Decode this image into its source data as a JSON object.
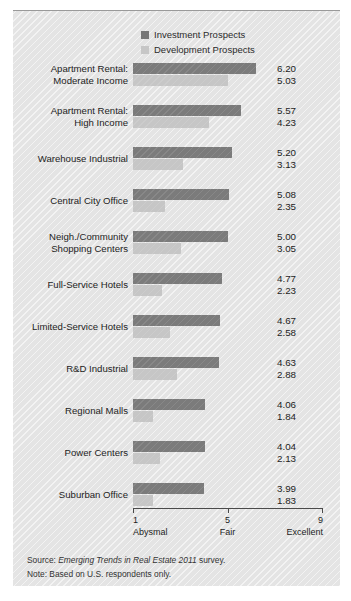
{
  "chart_data": {
    "type": "bar",
    "orientation": "horizontal",
    "title": "",
    "xlabel": "",
    "ylabel": "",
    "xlim": [
      1,
      9
    ],
    "grid": false,
    "legend_position": "top-center",
    "categories": [
      "Apartment Rental:\nModerate Income",
      "Apartment Rental:\nHigh Income",
      "Warehouse Industrial",
      "Central City Office",
      "Neigh./Community\nShopping Centers",
      "Full-Service Hotels",
      "Limited-Service Hotels",
      "R&D Industrial",
      "Regional Malls",
      "Power Centers",
      "Suburban Office"
    ],
    "series": [
      {
        "name": "Investment Prospects",
        "color": "#7b7b7b",
        "values": [
          6.2,
          5.57,
          5.2,
          5.08,
          5.0,
          4.77,
          4.67,
          4.63,
          4.06,
          4.04,
          3.99
        ]
      },
      {
        "name": "Development Prospects",
        "color": "#c6c6c6",
        "values": [
          5.03,
          4.23,
          3.13,
          2.35,
          3.05,
          2.23,
          2.58,
          2.88,
          1.84,
          2.13,
          1.83
        ]
      }
    ],
    "axis_ticks": [
      {
        "value": 1,
        "label": "1",
        "sublabel": "Abysmal"
      },
      {
        "value": 5,
        "label": "5",
        "sublabel": "Fair"
      },
      {
        "value": 9,
        "label": "9",
        "sublabel": "Excellent"
      }
    ]
  },
  "legend": {
    "items": [
      {
        "label": "Investment Prospects",
        "color": "#7b7b7b"
      },
      {
        "label": "Development Prospects",
        "color": "#c6c6c6"
      }
    ]
  },
  "notes": {
    "source_prefix": "Source: ",
    "source_italic": "Emerging Trends in Real Estate 2011",
    "source_suffix": " survey.",
    "note_line": "Note: Based on U.S. respondents only."
  },
  "colors": {
    "panel_background": "#e4e4e4",
    "investment_bar": "#7b7b7b",
    "development_bar": "#c6c6c6",
    "axis": "#4a4a4a",
    "text": "#1d1d1d"
  }
}
